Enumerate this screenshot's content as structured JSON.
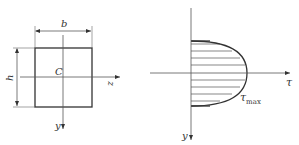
{
  "left_figure": {
    "title": "rectangular cross-section",
    "width_label": "b",
    "height_label": "h",
    "centroid_label": "C",
    "z_axis_label": "z",
    "y_axis_label": "y"
  },
  "right_figure": {
    "title": "shear stress distribution",
    "tau_axis_label": "τ",
    "y_axis_label": "y",
    "max_label_base": "τ",
    "max_label_sub": "max",
    "hatch_lines": 9
  },
  "colors": {
    "line": "#333333",
    "thin": "#555555",
    "background": "#ffffff"
  }
}
